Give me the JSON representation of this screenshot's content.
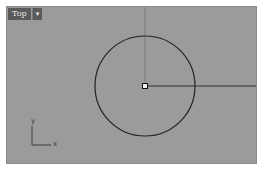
{
  "viewport": {
    "title": "Top",
    "dropdown_glyph": "▾",
    "background": "#9b9b9b"
  },
  "axis_icon": {
    "x_label": "x",
    "y_label": "y"
  },
  "geometry": {
    "circle": {
      "cx": 138,
      "cy": 79,
      "r": 50
    },
    "radius_line": {
      "x1": 138,
      "y1": 79,
      "x2": 251,
      "y2": 79
    },
    "center_marker": {
      "x": 138,
      "y": 79
    }
  }
}
